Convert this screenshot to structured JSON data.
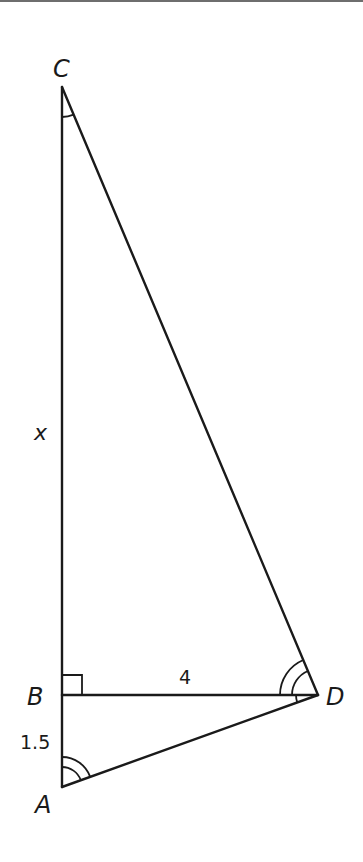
{
  "diagram": {
    "type": "geometry-triangle",
    "stroke_color": "#1a1a1a",
    "border_color": "#6e6e6e",
    "vertices": {
      "C": {
        "label": "C",
        "x": 62,
        "y": 87
      },
      "B": {
        "label": "B",
        "x": 62,
        "y": 695
      },
      "D": {
        "label": "D",
        "x": 318,
        "y": 695
      },
      "A": {
        "label": "A",
        "x": 62,
        "y": 787
      }
    },
    "segments": [
      {
        "from": "C",
        "to": "B",
        "label": "x"
      },
      {
        "from": "B",
        "to": "A",
        "label": "1.5"
      },
      {
        "from": "B",
        "to": "D",
        "label": "4"
      },
      {
        "from": "C",
        "to": "D",
        "label": ""
      },
      {
        "from": "D",
        "to": "A",
        "label": ""
      }
    ],
    "angle_marks": [
      {
        "at": "C",
        "between": [
          "CB",
          "CD"
        ],
        "arcs": 1
      },
      {
        "at": "B",
        "between": [
          "BC",
          "BD"
        ],
        "type": "right-angle"
      },
      {
        "at": "D",
        "between": [
          "DC",
          "DB"
        ],
        "arcs": 2
      },
      {
        "at": "D",
        "between": [
          "DB",
          "DA"
        ],
        "arcs": 1
      },
      {
        "at": "A",
        "between": [
          "AB",
          "AD"
        ],
        "arcs": 2
      }
    ],
    "labels": {
      "C": "C",
      "B": "B",
      "D": "D",
      "A": "A",
      "side_CB": "x",
      "side_BA": "1.5",
      "side_BD": "4"
    }
  }
}
